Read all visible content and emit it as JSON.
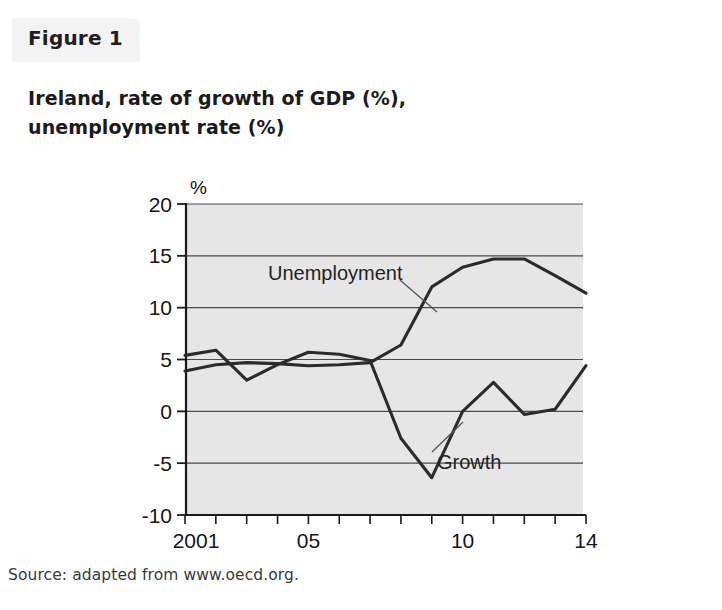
{
  "figure": {
    "label": "Figure 1",
    "title_line1": "Ireland, rate of growth of GDP (%),",
    "title_line2": "unemployment rate (%)",
    "source": "Source: adapted from www.oecd.org."
  },
  "colors": {
    "plot_background": "#e6e6e6",
    "line": "#2b2b2b",
    "gridline": "#4a4a4a",
    "axis": "#1a1a1a",
    "page_background": "#ffffff",
    "tab_background": "#f3f3f3"
  },
  "chart_data": {
    "type": "line",
    "title": "Ireland, rate of growth of GDP (%), unemployment rate (%)",
    "subtitle": "",
    "xlabel": "",
    "ylabel": "%",
    "unit_label": "%",
    "x": [
      2001,
      2002,
      2003,
      2004,
      2005,
      2006,
      2007,
      2008,
      2009,
      2010,
      2011,
      2012,
      2013,
      2014
    ],
    "xlim": [
      2001,
      2014
    ],
    "ylim": [
      -10,
      20
    ],
    "yticks": [
      20,
      15,
      10,
      5,
      0,
      -5,
      -10
    ],
    "ytick_labels": [
      "20",
      "15",
      "10",
      "5",
      "0",
      "-5",
      "-10"
    ],
    "xticks": [
      2001,
      2002,
      2003,
      2004,
      2005,
      2006,
      2007,
      2008,
      2009,
      2010,
      2011,
      2012,
      2013,
      2014
    ],
    "xtick_labels": [
      "2001",
      "",
      "",
      "",
      "05",
      "",
      "",
      "",
      "",
      "10",
      "",
      "",
      "",
      "14"
    ],
    "grid": true,
    "grid_axis": "y",
    "legend_position": "inline-annotations",
    "series": [
      {
        "name": "Unemployment",
        "annotation": "Unemployment",
        "values": [
          3.9,
          4.5,
          4.7,
          4.6,
          4.4,
          4.5,
          4.7,
          6.4,
          12.0,
          13.9,
          14.7,
          14.7,
          13.1,
          11.4
        ]
      },
      {
        "name": "Growth",
        "annotation": "Growth",
        "values": [
          5.4,
          5.9,
          3.0,
          4.5,
          5.7,
          5.5,
          4.9,
          -2.6,
          -6.4,
          0.0,
          2.8,
          -0.3,
          0.2,
          4.4
        ]
      }
    ],
    "annotations": [
      {
        "text": "Unemployment",
        "x": 2007.1,
        "y": 12.9
      },
      {
        "text": "Growth",
        "x": 2010.0,
        "y": -3.1
      }
    ]
  }
}
